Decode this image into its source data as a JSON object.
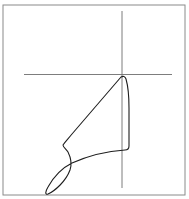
{
  "figure": {
    "width": 189,
    "height": 199,
    "background": "#ffffff",
    "frame": {
      "x": 3,
      "y": 5,
      "width": 182,
      "height": 190,
      "color": "#8a8a8a"
    },
    "crosshair": {
      "color": "#6e6e6e",
      "vertical": {
        "x": 122,
        "y1": 11,
        "y2": 188
      },
      "horizontal": {
        "y": 74.5,
        "x1": 24,
        "x2": 172
      }
    },
    "curve": {
      "color": "#1e1e1e",
      "stroke_width": 1.1,
      "path": "M 121 77 C 123 76, 125 76, 126 79 C 128 86, 129 95, 129 108 L 129 146 C 129 149, 128 150, 125 150 C 110 151, 90 155, 72 163 C 62 168, 53 178, 48 187 C 45 192, 45 195, 48 194 C 55 191, 66 181, 70 170 C 72 164, 71 158, 68 152 C 66 149, 63 147, 63 145 C 65 142, 68 139, 72 134 L 121 77 Z"
    }
  }
}
